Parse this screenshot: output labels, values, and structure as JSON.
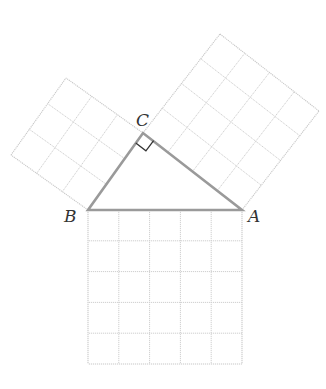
{
  "diagram": {
    "title": "",
    "vertices": [
      {
        "id": "A",
        "label": "A"
      },
      {
        "id": "B",
        "label": "B"
      },
      {
        "id": "C",
        "label": "C"
      }
    ],
    "squares": [
      {
        "side": "BC",
        "units": 3
      },
      {
        "side": "CA",
        "units": 4
      },
      {
        "side": "AB",
        "units": 5
      }
    ],
    "right_angle_at": "C",
    "colors": {
      "triangle": "#9a9a9a",
      "grid": "#cfcfcf",
      "right_angle_marker": "#333333",
      "labels": "#333333"
    }
  }
}
